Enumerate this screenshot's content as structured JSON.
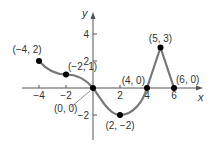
{
  "chart_data": {
    "type": "line",
    "title": "",
    "xlabel": "x",
    "ylabel": "y",
    "xlim": [
      -4.5,
      8
    ],
    "ylim": [
      -3.8,
      5.5
    ],
    "x_ticks": [
      -4,
      -2,
      2,
      4,
      6
    ],
    "y_ticks": [
      4,
      2,
      -2
    ],
    "x_tick_labels": [
      "−4",
      "−2",
      "2",
      "4",
      "6"
    ],
    "y_tick_labels": [
      "4",
      "2",
      "−2"
    ],
    "grid": false,
    "legend": null,
    "points": [
      {
        "x": -4,
        "y": 2,
        "label": "(−4, 2)"
      },
      {
        "x": -2,
        "y": 1,
        "label": "(−2, 1)"
      },
      {
        "x": 0,
        "y": 0,
        "label": "(0, 0)"
      },
      {
        "x": 2,
        "y": -2,
        "label": "(2, −2)"
      },
      {
        "x": 4,
        "y": 0,
        "label": "(4, 0)"
      },
      {
        "x": 5,
        "y": 3,
        "label": "(5, 3)"
      },
      {
        "x": 6,
        "y": 0,
        "label": "(6, 0)"
      }
    ],
    "curve_color": "#777777",
    "point_color": "#000000"
  }
}
